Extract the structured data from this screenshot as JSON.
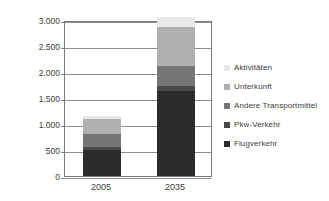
{
  "chart_data": {
    "type": "bar",
    "subtype": "stacked-bar",
    "title": "",
    "xlabel": "",
    "ylabel": "Mio. t CO2",
    "ylabel_display": "Mio. t CO",
    "ylabel_subscript": "2",
    "categories": [
      "2005",
      "2035"
    ],
    "ylim": [
      0,
      3000
    ],
    "ytick_values": [
      0,
      500,
      1000,
      1500,
      2000,
      2500,
      3000
    ],
    "ytick_labels": [
      "0",
      "500",
      "1.000",
      "1.500",
      "2.000",
      "2.500",
      "3.000"
    ],
    "grid": true,
    "legend_position": "right",
    "series": [
      {
        "name": "Flugverkehr",
        "values": [
          500,
          1640
        ],
        "color": "#2b2b2b"
      },
      {
        "name": "Pkw-Verkehr",
        "values": [
          50,
          100
        ],
        "color": "#4a4a4a"
      },
      {
        "name": "Andere Transportmittel",
        "values": [
          250,
          370
        ],
        "color": "#757575"
      },
      {
        "name": "Unterkunft",
        "values": [
          300,
          750
        ],
        "color": "#b0b0b0"
      },
      {
        "name": "Aktivitäten",
        "values": [
          50,
          190
        ],
        "color": "#e8e8e8"
      }
    ],
    "totals": [
      1150,
      3050
    ],
    "legend_order_top_to_bottom": [
      "Aktivitäten",
      "Unterkunft",
      "Andere Transportmittel",
      "Pkw-Verkehr",
      "Flugverkehr"
    ]
  },
  "legend": {
    "items": [
      {
        "label": "Aktivitäten",
        "color": "#e8e8e8"
      },
      {
        "label": "Unterkunft",
        "color": "#b0b0b0"
      },
      {
        "label": "Andere Transportmittel",
        "color": "#757575"
      },
      {
        "label": "Pkw-Verkehr",
        "color": "#4a4a4a"
      },
      {
        "label": "Flugverkehr",
        "color": "#2b2b2b"
      }
    ]
  }
}
